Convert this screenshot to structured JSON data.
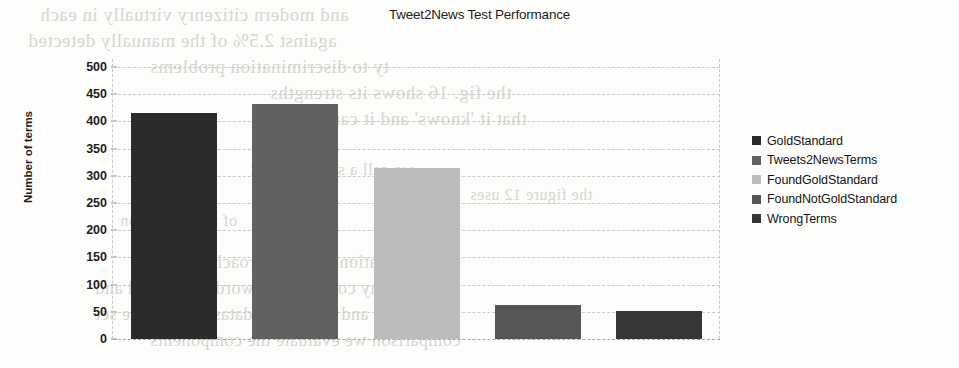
{
  "chart_data": {
    "type": "bar",
    "title": "Tweet2News Test Performance",
    "xlabel": "",
    "ylabel": "Number of terms",
    "categories": [
      "GoldStandard",
      "Tweets2NewsTerms",
      "FoundGoldStandard",
      "FoundNotGoldStandard",
      "WrongTerms"
    ],
    "values": [
      415,
      432,
      315,
      62,
      52
    ],
    "ylim": [
      0,
      500
    ],
    "yticks": [
      0,
      50,
      100,
      150,
      200,
      250,
      300,
      350,
      400,
      450,
      500
    ],
    "grid": true,
    "legend_position": "right",
    "colors": [
      "#2b2b2b",
      "#616161",
      "#bcbcbc",
      "#565656",
      "#363636"
    ],
    "series": [
      {
        "name": "GoldStandard",
        "value": 415,
        "color": "#2b2b2b"
      },
      {
        "name": "Tweets2NewsTerms",
        "value": 432,
        "color": "#616161"
      },
      {
        "name": "FoundGoldStandard",
        "value": 315,
        "color": "#bcbcbc"
      },
      {
        "name": "FoundNotGoldStandard",
        "value": 62,
        "color": "#565656"
      },
      {
        "name": "WrongTerms",
        "value": 52,
        "color": "#363636"
      }
    ]
  },
  "legend": {
    "items": [
      {
        "label": "GoldStandard",
        "color": "#2b2b2b"
      },
      {
        "label": "Tweets2NewsTerms",
        "color": "#616161"
      },
      {
        "label": "FoundGoldStandard",
        "color": "#bcbcbc"
      },
      {
        "label": "FoundNotGoldStandard",
        "color": "#565656"
      },
      {
        "label": "WrongTerms",
        "color": "#363636"
      }
    ]
  },
  "page_showthrough": {
    "lines": [
      {
        "text": "and modern citizenry virtually in each",
        "x": 40,
        "y": 4,
        "size": 19
      },
      {
        "text": "against 2.5% of the manually detected",
        "x": 28,
        "y": 30,
        "size": 19
      },
      {
        "text": "ty to discrimination problems",
        "x": 150,
        "y": 56,
        "size": 19
      },
      {
        "text": "the fig. 16 shows its strengths",
        "x": 270,
        "y": 82,
        "size": 19
      },
      {
        "text": "that it 'knows' and it can",
        "x": 330,
        "y": 108,
        "size": 19
      },
      {
        "text": "we call a small dataset",
        "x": 250,
        "y": 160,
        "size": 17
      },
      {
        "text": "the figure 12 uses",
        "x": 470,
        "y": 186,
        "size": 16
      },
      {
        "text": "of the annotation",
        "x": 120,
        "y": 212,
        "size": 16
      },
      {
        "text": "is a validation of our approach that the",
        "x": 150,
        "y": 252,
        "size": 18
      },
      {
        "text": "any corpus; each word in the gold and",
        "x": 95,
        "y": 278,
        "size": 18
      },
      {
        "text": "and consider a dataset as a mere set",
        "x": 95,
        "y": 304,
        "size": 18
      },
      {
        "text": "comparison we evaluate the components",
        "x": 150,
        "y": 330,
        "size": 18
      }
    ]
  }
}
